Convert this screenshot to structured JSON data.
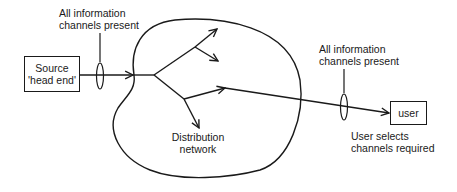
{
  "diagram": {
    "source_box": {
      "line1": "Source",
      "line2": "'head end'"
    },
    "user_box": {
      "label": "user"
    },
    "label_left": {
      "line1": "All information",
      "line2": "channels present"
    },
    "label_right": {
      "line1": "All information",
      "line2": "channels present"
    },
    "label_network": {
      "line1": "Distribution",
      "line2": "network"
    },
    "label_user": {
      "line1": "User selects",
      "line2": "channels required"
    },
    "colors": {
      "stroke": "#1a1a1a",
      "background": "#ffffff"
    }
  }
}
